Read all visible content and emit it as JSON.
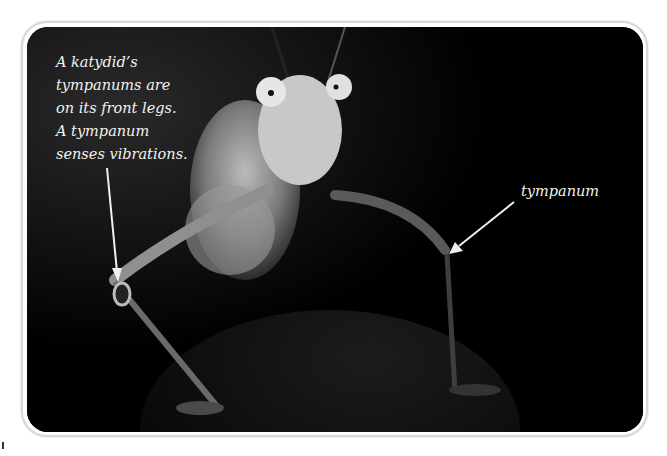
{
  "figure": {
    "caption": "A katydid’s\ntympanums are\non its front legs.\nA tympanum\nsenses vibrations.",
    "label": "tympanum",
    "colors": {
      "background": "#000000",
      "text": "#f2f2f2",
      "frame": "#d8d8d8"
    }
  }
}
